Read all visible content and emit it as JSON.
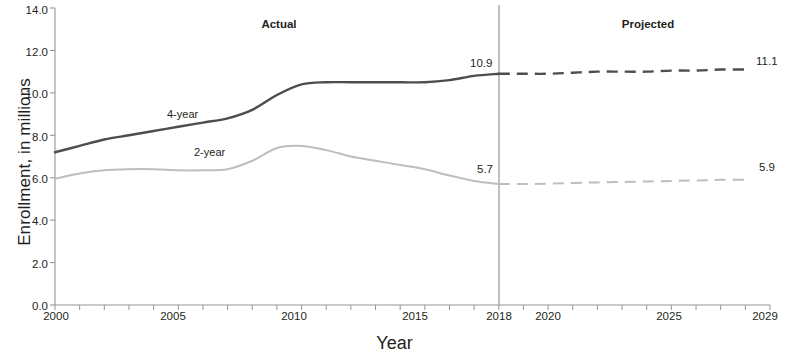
{
  "chart_data": {
    "type": "line",
    "title": "",
    "xlabel": "Year",
    "ylabel": "Enrollment, in millions",
    "xlim": [
      2000,
      2029
    ],
    "ylim": [
      0.0,
      14.0
    ],
    "grid": false,
    "legend_position": "inline-annotation",
    "x": [
      2000,
      2001,
      2002,
      2003,
      2004,
      2005,
      2006,
      2007,
      2008,
      2009,
      2010,
      2011,
      2012,
      2013,
      2014,
      2015,
      2016,
      2017,
      2018,
      2019,
      2020,
      2021,
      2022,
      2023,
      2024,
      2025,
      2026,
      2027,
      2028,
      2029
    ],
    "y_ticks": [
      "0.0",
      "2.0",
      "4.0",
      "6.0",
      "8.0",
      "10.0",
      "12.0",
      "14.0"
    ],
    "x_ticks": [
      "2000",
      "2005",
      "2010",
      "2015",
      "2018",
      "2020",
      "2025",
      "2029"
    ],
    "series": [
      {
        "name": "4-year",
        "color": "#4d4d4f",
        "actual_values": [
          7.2,
          7.5,
          7.8,
          8.0,
          8.2,
          8.4,
          8.6,
          8.8,
          9.2,
          9.9,
          10.4,
          10.5,
          10.5,
          10.5,
          10.5,
          10.5,
          10.6,
          10.8,
          10.9
        ],
        "projected_values": [
          10.9,
          10.9,
          10.9,
          10.95,
          11.0,
          11.0,
          11.0,
          11.05,
          11.05,
          11.1,
          11.1
        ],
        "endpoint_actual_label": "10.9",
        "endpoint_projected_label": "11.1"
      },
      {
        "name": "2-year",
        "color": "#bcbec0",
        "actual_values": [
          5.95,
          6.2,
          6.35,
          6.4,
          6.4,
          6.35,
          6.35,
          6.4,
          6.8,
          7.4,
          7.5,
          7.3,
          7.0,
          6.8,
          6.6,
          6.4,
          6.1,
          5.85,
          5.7
        ],
        "projected_values": [
          5.7,
          5.7,
          5.72,
          5.75,
          5.78,
          5.8,
          5.82,
          5.85,
          5.87,
          5.9,
          5.9
        ],
        "endpoint_actual_label": "5.7",
        "endpoint_projected_label": "5.9"
      }
    ],
    "divider_year": 2018,
    "annotations": {
      "actual": "Actual",
      "projected": "Projected",
      "series_label_4year": "4-year",
      "series_label_2year": "2-year"
    }
  },
  "axis": {
    "y_label": "Enrollment, in millions",
    "x_label": "Year",
    "y_ticks": [
      "14.0",
      "12.0",
      "10.0",
      "8.0",
      "6.0",
      "4.0",
      "2.0",
      "0.0"
    ],
    "x_ticks": [
      "2000",
      "2005",
      "2010",
      "2015",
      "2018",
      "2020",
      "2025",
      "2029"
    ]
  },
  "labels": {
    "actual": "Actual",
    "projected": "Projected",
    "four_year": "4-year",
    "two_year": "2-year",
    "four_year_actual_end": "10.9",
    "four_year_projected_end": "11.1",
    "two_year_actual_end": "5.7",
    "two_year_projected_end": "5.9"
  },
  "colors": {
    "four_year_line": "#4d4d4f",
    "two_year_line": "#bcbec0",
    "axis": "#231f20",
    "divider": "#939598",
    "background": "#ffffff"
  }
}
